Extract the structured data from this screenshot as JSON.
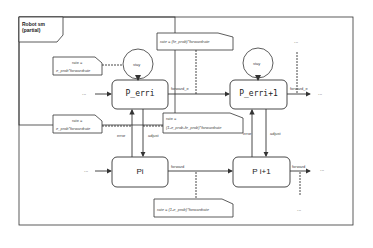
{
  "frame": {
    "title_line1": "Robot sm",
    "title_line2": "(partial)"
  },
  "states": {
    "p_erri": {
      "label": "P_erri"
    },
    "p_erri1": {
      "label": "P_erri+1"
    },
    "pi": {
      "label": "Pi"
    },
    "pi1": {
      "label": "P i+1"
    }
  },
  "loops": {
    "stay1": "stay",
    "stay2": "stay"
  },
  "transitions": {
    "forward_e1": "forward_e",
    "forward_e2": "forward_e",
    "forward1": "forward",
    "forward2": "forward",
    "error1": "error",
    "error2": "error",
    "adjust1": "adjust",
    "adjust2": "adjust"
  },
  "notes": {
    "top_rate": "rate = (fe_prob)*forwardrate",
    "stay_rate_line1": "rate =",
    "stay_rate_line2": "e_prob*forwardrate",
    "error_rate_line1": "rate =",
    "error_rate_line2": "e_prob*forwardrate",
    "adjust_rate_line1": "rate =",
    "adjust_rate_line2": "(1-e_prob-fe_prob)*forwardrate",
    "bottom_rate": "rate = (1-e_prob)*forwardrate"
  },
  "ellipsis": {
    "left_top": "...",
    "left_bottom": "...",
    "right_top": "...",
    "right_bottom": "...",
    "top_right": "...",
    "bottom_right": "..."
  }
}
